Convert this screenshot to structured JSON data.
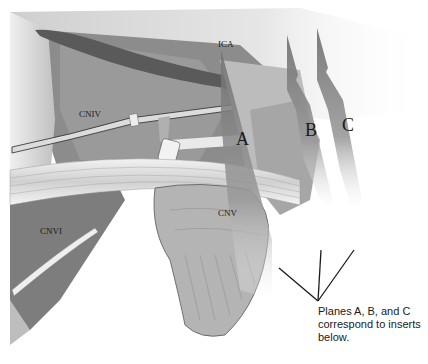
{
  "figure": {
    "structures": {
      "ica": "ICA",
      "cniv": "CNIV",
      "cnvi": "CNVI",
      "cnv": "CNV"
    },
    "planes": [
      {
        "letter": "A"
      },
      {
        "letter": "B"
      },
      {
        "letter": "C"
      }
    ],
    "caption": {
      "line1": "Planes A, B, and C",
      "line2": "correspond to inserts",
      "line3": "below."
    },
    "colors": {
      "background": "#ffffff",
      "tissue_dark": "#6e6e6e",
      "tissue_mid": "#a8a8a8",
      "tissue_light": "#dcdcdc",
      "plane_fill": "#7a7a7a",
      "line": "#1a1a1a"
    }
  }
}
